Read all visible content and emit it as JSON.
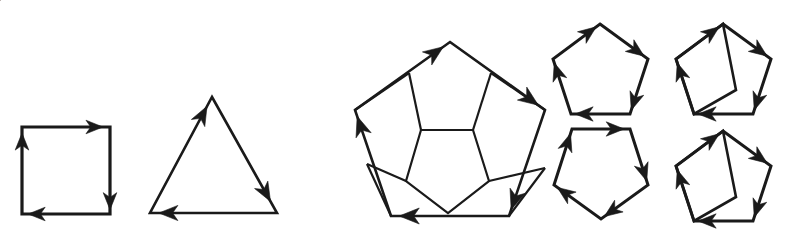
{
  "figure": {
    "description": "Black line-art figure on a white background showing closed polygons whose edges carry arrowheads indicating a consistent traversal direction: a square, a triangle, a large pentagon decorated with an inner pentagon and five quadrilateral petals, and four small pentagon variants.",
    "background_color": "#ffffff",
    "stroke_color": "#1a1a1a",
    "canvas": {
      "width": 794,
      "height": 236
    }
  },
  "shapes": [
    {
      "id": "square",
      "name": "directed-square",
      "label": "Square with clockwise arrows",
      "sides": 4,
      "direction": "clockwise",
      "stroke_width": 3.2,
      "vertices": [
        [
          22,
          127
        ],
        [
          110,
          127
        ],
        [
          110,
          214
        ],
        [
          22,
          214
        ]
      ],
      "closed": true,
      "arrows": [
        {
          "edge": 0,
          "t": 0.92,
          "label": "top-edge-arrow-right"
        },
        {
          "edge": 1,
          "t": 0.95,
          "label": "right-edge-arrow-down"
        },
        {
          "edge": 2,
          "t": 0.93,
          "label": "bottom-edge-arrow-left"
        },
        {
          "edge": 3,
          "t": 0.93,
          "label": "left-edge-arrow-up"
        }
      ],
      "arrow_size": 17
    },
    {
      "id": "triangle",
      "name": "directed-triangle",
      "label": "Triangle with counter-clockwise arrows",
      "sides": 3,
      "direction": "counter-clockwise",
      "stroke_width": 2.6,
      "vertices": [
        [
          212,
          97
        ],
        [
          277,
          213
        ],
        [
          150,
          213
        ]
      ],
      "closed": true,
      "arrows": [
        {
          "edge": 0,
          "t": 0.9,
          "label": "right-leg-arrow-down"
        },
        {
          "edge": 1,
          "t": 0.93,
          "label": "base-arrow-left"
        },
        {
          "edge": 2,
          "t": 0.92,
          "label": "left-leg-arrow-up"
        }
      ],
      "arrow_size": 19
    },
    {
      "id": "large-pentagon",
      "name": "directed-pentagon-large",
      "label": "Large pentagon with counter-clockwise arrows",
      "sides": 5,
      "direction": "counter-clockwise",
      "stroke_width": 2.6,
      "vertices": [
        [
          450,
          42
        ],
        [
          545,
          110
        ],
        [
          509,
          216
        ],
        [
          391,
          216
        ],
        [
          355,
          110
        ]
      ],
      "closed": true,
      "arrows": [
        {
          "edge": 0,
          "t": 0.93,
          "label": "upper-right-edge-arrow"
        },
        {
          "edge": 1,
          "t": 0.94,
          "label": "lower-right-edge-arrow"
        },
        {
          "edge": 2,
          "t": 0.93,
          "label": "bottom-edge-arrow"
        },
        {
          "edge": 3,
          "t": 0.94,
          "label": "lower-left-edge-arrow"
        },
        {
          "edge": 4,
          "t": 0.93,
          "label": "upper-left-edge-arrow"
        }
      ],
      "arrow_size": 20
    },
    {
      "id": "inner-pentagon",
      "name": "inner-pentagon-outline",
      "label": "Inner pentagon of the large figure",
      "sides": 5,
      "direction": "none",
      "stroke_width": 2.2,
      "vertices": [
        [
          421,
          130
        ],
        [
          473,
          130
        ],
        [
          489,
          181
        ],
        [
          448,
          213
        ],
        [
          406,
          181
        ]
      ],
      "closed": true,
      "arrows": [],
      "arrow_size": 0
    },
    {
      "id": "petal-spokes",
      "name": "pentagon-petal-spokes",
      "label": "Connecting spokes forming five quadrilateral petals",
      "sides": 0,
      "direction": "none",
      "stroke_width": 2.2,
      "segments": [
        [
          [
            421,
            130
          ],
          [
            409,
            73
          ]
        ],
        [
          [
            473,
            130
          ],
          [
            491,
            73
          ]
        ],
        [
          [
            489,
            181
          ],
          [
            545,
            168
          ]
        ],
        [
          [
            406,
            181
          ],
          [
            367,
            164
          ]
        ],
        [
          [
            409,
            73
          ],
          [
            355,
            110
          ]
        ],
        [
          [
            491,
            73
          ],
          [
            545,
            110
          ]
        ],
        [
          [
            545,
            168
          ],
          [
            509,
            216
          ]
        ],
        [
          [
            367,
            164
          ],
          [
            391,
            216
          ]
        ]
      ],
      "arrows": [],
      "arrow_size": 0
    },
    {
      "id": "small-pentagon-tl",
      "name": "directed-pentagon-small-top-left",
      "label": "Small pentagon, apex up, counter-clockwise arrows",
      "sides": 5,
      "direction": "counter-clockwise",
      "stroke_width": 3.0,
      "vertices": [
        [
          600,
          24
        ],
        [
          648,
          59
        ],
        [
          630,
          114
        ],
        [
          571,
          114
        ],
        [
          553,
          59
        ]
      ],
      "closed": true,
      "arrows": [
        {
          "edge": 0,
          "t": 0.92,
          "label": "edge-arrow-1"
        },
        {
          "edge": 1,
          "t": 0.93,
          "label": "edge-arrow-2"
        },
        {
          "edge": 2,
          "t": 0.93,
          "label": "edge-arrow-3"
        },
        {
          "edge": 3,
          "t": 0.93,
          "label": "edge-arrow-4"
        },
        {
          "edge": 4,
          "t": 0.92,
          "label": "edge-arrow-5"
        }
      ],
      "arrow_size": 18
    },
    {
      "id": "small-pentagon-bl",
      "name": "directed-pentagon-small-bottom-left",
      "label": "Small pentagon, flat top, clockwise arrows",
      "sides": 5,
      "direction": "clockwise",
      "stroke_width": 3.0,
      "vertices": [
        [
          572,
          129
        ],
        [
          630,
          129
        ],
        [
          648,
          185
        ],
        [
          601,
          219
        ],
        [
          554,
          185
        ]
      ],
      "closed": true,
      "arrows": [
        {
          "edge": 0,
          "t": 0.9,
          "label": "edge-arrow-1"
        },
        {
          "edge": 1,
          "t": 0.93,
          "label": "edge-arrow-2"
        },
        {
          "edge": 2,
          "t": 0.93,
          "label": "edge-arrow-3"
        },
        {
          "edge": 3,
          "t": 0.93,
          "label": "edge-arrow-4"
        },
        {
          "edge": 4,
          "t": 0.92,
          "label": "edge-arrow-5"
        }
      ],
      "arrow_size": 18
    },
    {
      "id": "small-pentagon-tr",
      "name": "directed-pentagon-small-top-right",
      "label": "Small pentagon with inscribed rotated quadrilateral, top right",
      "sides": 5,
      "direction": "counter-clockwise",
      "stroke_width": 3.0,
      "vertices": [
        [
          723,
          24
        ],
        [
          771,
          59
        ],
        [
          753,
          114
        ],
        [
          694,
          114
        ],
        [
          676,
          59
        ]
      ],
      "closed": true,
      "arrows": [
        {
          "edge": 0,
          "t": 0.92,
          "label": "edge-arrow-1"
        },
        {
          "edge": 1,
          "t": 0.93,
          "label": "edge-arrow-2"
        },
        {
          "edge": 2,
          "t": 0.93,
          "label": "edge-arrow-3"
        },
        {
          "edge": 3,
          "t": 0.93,
          "label": "edge-arrow-4"
        },
        {
          "edge": 4,
          "t": 0.92,
          "label": "edge-arrow-5"
        }
      ],
      "arrow_size": 18
    },
    {
      "id": "inscribed-quad-tr",
      "name": "inscribed-quadrilateral-top-right",
      "label": "Rotated inscribed quadrilateral, top right pentagon",
      "sides": 4,
      "direction": "none",
      "stroke_width": 2.6,
      "vertices": [
        [
          723,
          24
        ],
        [
          736,
          90
        ],
        [
          694,
          114
        ],
        [
          676,
          59
        ]
      ],
      "closed": true,
      "arrows": [],
      "arrow_size": 0
    },
    {
      "id": "small-pentagon-br",
      "name": "directed-pentagon-small-bottom-right",
      "label": "Small pentagon with inscribed rotated quadrilateral, bottom right",
      "sides": 5,
      "direction": "counter-clockwise",
      "stroke_width": 3.0,
      "vertices": [
        [
          723,
          131
        ],
        [
          771,
          166
        ],
        [
          753,
          221
        ],
        [
          694,
          221
        ],
        [
          676,
          166
        ]
      ],
      "closed": true,
      "arrows": [
        {
          "edge": 0,
          "t": 0.92,
          "label": "edge-arrow-1"
        },
        {
          "edge": 1,
          "t": 0.93,
          "label": "edge-arrow-2"
        },
        {
          "edge": 2,
          "t": 0.93,
          "label": "edge-arrow-3"
        },
        {
          "edge": 3,
          "t": 0.93,
          "label": "edge-arrow-4"
        },
        {
          "edge": 4,
          "t": 0.92,
          "label": "edge-arrow-5"
        }
      ],
      "arrow_size": 18
    },
    {
      "id": "inscribed-quad-br",
      "name": "inscribed-quadrilateral-bottom-right",
      "label": "Rotated inscribed quadrilateral, bottom right pentagon",
      "sides": 4,
      "direction": "none",
      "stroke_width": 2.6,
      "vertices": [
        [
          723,
          131
        ],
        [
          736,
          197
        ],
        [
          694,
          221
        ],
        [
          676,
          166
        ]
      ],
      "closed": true,
      "arrows": [],
      "arrow_size": 0
    }
  ]
}
